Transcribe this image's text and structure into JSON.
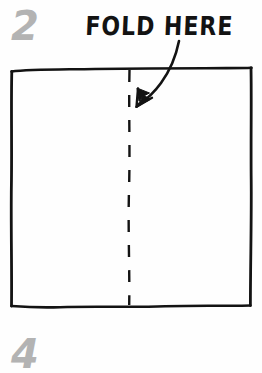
{
  "diagram": {
    "step_number_top": "2",
    "step_number_bottom": "4",
    "fold_label": "FOLD HERE",
    "colors": {
      "ink": "#131313",
      "step_number_gray": "#b3b3b3",
      "paper": "#fefefe",
      "background": "#ffffff"
    },
    "paper_sheet": {
      "shape": "square",
      "left": 11,
      "top": 69,
      "right": 251,
      "bottom": 305,
      "stroke_style": "hand-drawn"
    },
    "fold_line": {
      "style": "dashed",
      "orientation": "vertical",
      "x": 129,
      "from_y": 70,
      "to_y": 305,
      "dash_length": 12,
      "gap_length": 13
    },
    "arrow": {
      "style": "curved",
      "points_to": "fold-line",
      "direction": "down-left",
      "start_x": 179,
      "start_y": 41,
      "tip_x": 136,
      "tip_y": 107
    }
  }
}
